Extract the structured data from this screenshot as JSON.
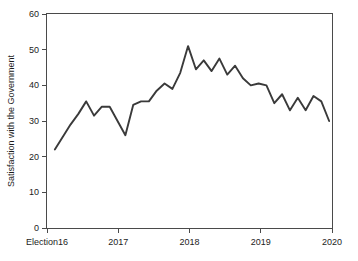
{
  "chart_data": {
    "type": "line",
    "title": "",
    "xlabel": "",
    "ylabel": "Satisfaction with the Government",
    "ylim": [
      0,
      60
    ],
    "yticks": [
      0,
      10,
      20,
      30,
      40,
      50,
      60
    ],
    "ytick_labels": [
      "0",
      "10",
      "20",
      "30",
      "40",
      "50",
      "60"
    ],
    "xlim": [
      2016.0,
      2020.0
    ],
    "xticks": [
      2016.0,
      2017.0,
      2018.0,
      2019.0,
      2020.0
    ],
    "xtick_labels": [
      "Election16",
      "2017",
      "2018",
      "2019",
      "2020"
    ],
    "grid": false,
    "legend": false,
    "frame": "full-box",
    "line_color": "#3a3a3a",
    "series": [
      {
        "name": "Satisfaction with the Government",
        "x": [
          2016.11,
          2016.22,
          2016.33,
          2016.44,
          2016.55,
          2016.66,
          2016.77,
          2016.88,
          2016.99,
          2017.1,
          2017.21,
          2017.32,
          2017.43,
          2017.54,
          2017.65,
          2017.76,
          2017.87,
          2017.98,
          2018.09,
          2018.2,
          2018.31,
          2018.42,
          2018.53,
          2018.64,
          2018.75,
          2018.86,
          2018.97,
          2019.08,
          2019.19,
          2019.3,
          2019.41,
          2019.52,
          2019.63,
          2019.74,
          2019.85,
          2019.96
        ],
        "values": [
          22.0,
          25.5,
          29.0,
          32.0,
          35.5,
          31.5,
          34.0,
          34.0,
          30.0,
          26.0,
          34.5,
          35.5,
          35.5,
          38.5,
          40.5,
          39.0,
          43.5,
          51.0,
          44.5,
          47.0,
          44.0,
          47.5,
          43.0,
          45.5,
          42.0,
          40.0,
          40.5,
          40.0,
          35.0,
          37.5,
          33.0,
          36.5,
          33.0,
          37.0,
          35.5,
          30.0
        ]
      }
    ]
  },
  "axes": {
    "y_title": "Satisfaction with the Government"
  }
}
